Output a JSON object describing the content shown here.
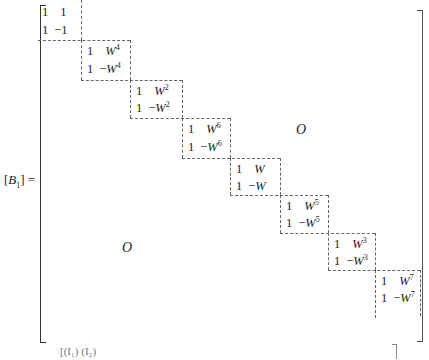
{
  "equation": {
    "lhs": {
      "symbol": "B",
      "subscript": "1",
      "open": "[",
      "close": "]",
      "equals": "="
    },
    "blocks": [
      {
        "r1": [
          "1",
          "1"
        ],
        "r2": [
          "1",
          "-1"
        ],
        "exp": ""
      },
      {
        "r1": [
          "1",
          "W"
        ],
        "r2": [
          "1",
          "-W"
        ],
        "exp": "4"
      },
      {
        "r1": [
          "1",
          "W"
        ],
        "r2": [
          "1",
          "-W"
        ],
        "exp": "2"
      },
      {
        "r1": [
          "1",
          "W"
        ],
        "r2": [
          "1",
          "-W"
        ],
        "exp": "6"
      },
      {
        "r1": [
          "1",
          "W"
        ],
        "r2": [
          "1",
          "-W"
        ],
        "exp": ""
      },
      {
        "r1": [
          "1",
          "W"
        ],
        "r2": [
          "1",
          "-W"
        ],
        "exp": "5"
      },
      {
        "r1": [
          "1",
          "W"
        ],
        "r2": [
          "1",
          "-W"
        ],
        "exp": "3"
      },
      {
        "r1": [
          "1",
          "W"
        ],
        "r2": [
          "1",
          "-W"
        ],
        "exp": "7"
      }
    ],
    "zero_upper": "O",
    "zero_lower": "O",
    "next_line_fragment": "[(I₁)  (I₂)"
  }
}
